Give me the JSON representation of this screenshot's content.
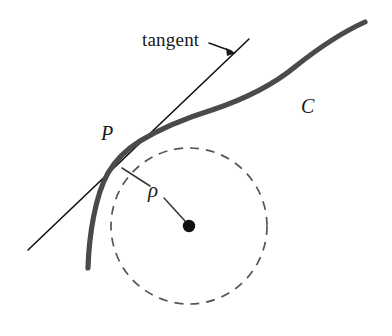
{
  "figure": {
    "width": 392,
    "height": 336,
    "background_color": "#ffffff"
  },
  "labels": {
    "tangent": "tangent",
    "point_p": "P",
    "radius_rho": "ρ",
    "curve_c": "C"
  },
  "colors": {
    "curve": "#4a4a4a",
    "tangent_line": "#111111",
    "circle_dashed": "#555555",
    "center_dot": "#111111",
    "leader_line": "#1a1a1a",
    "radius_line": "#3a3a3a",
    "text": "#1a1a1a"
  },
  "geometry": {
    "curve_c": {
      "type": "curve",
      "stroke_width": 5.2,
      "start_point": [
        88,
        268
      ],
      "tangency_point": [
        116,
        161
      ],
      "inflection_point": [
        205,
        110
      ],
      "end_point": [
        365,
        22
      ],
      "path": "M 88,268 C 89,236 95,196 108,173 C 115,161 124,151 140,141 C 160,129 186,118 212,110 C 242,100 272,86 296,66 C 320,47 345,31 365,22"
    },
    "tangent_line": {
      "type": "line",
      "stroke_width": 1.6,
      "start_point": [
        28,
        250
      ],
      "end_point": [
        249,
        39
      ]
    },
    "osculating_circle": {
      "type": "circle",
      "center": [
        189,
        226
      ],
      "radius": 78,
      "stroke_width": 1.7,
      "dash_pattern": "9,7",
      "style": "dashed"
    },
    "center_dot": {
      "type": "dot",
      "center": [
        189,
        226
      ],
      "radius": 6.2
    },
    "radius_line": {
      "type": "segmented-line",
      "stroke_width": 1.6,
      "segment_1": [
        [
          122,
          168
        ],
        [
          150,
          186
        ]
      ],
      "segment_2": [
        [
          164,
          198
        ],
        [
          185,
          221
        ]
      ]
    },
    "leader_line": {
      "type": "line-with-arrow",
      "stroke_width": 1.6,
      "start_point": [
        209,
        43
      ],
      "end_point": [
        235,
        53
      ],
      "arrow_head_size": 7
    }
  }
}
